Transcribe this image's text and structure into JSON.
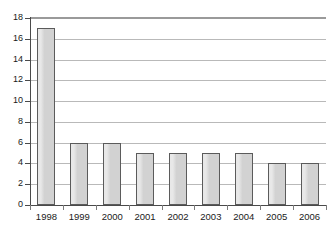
{
  "chart_data": {
    "type": "bar",
    "title": "",
    "subtitle": "",
    "xlabel": "",
    "ylabel": "",
    "categories": [
      "1998",
      "1999",
      "2000",
      "2001",
      "2002",
      "2003",
      "2004",
      "2005",
      "2006"
    ],
    "values": [
      17,
      6,
      6,
      5,
      5,
      5,
      5,
      4,
      4
    ],
    "ylim": [
      0,
      18
    ],
    "ytick_step": 2,
    "yticks": [
      0,
      2,
      4,
      6,
      8,
      10,
      12,
      14,
      16,
      18
    ],
    "ytick_labels": [
      "0",
      "2",
      "4",
      "6",
      "8",
      "10",
      "12",
      "14",
      "16",
      "18"
    ],
    "grid": true,
    "grid_axis": "y",
    "legend": false,
    "legend_position": "none",
    "annotations": [],
    "colors": {
      "bar_fill": "#d6d6d6",
      "bar_border": "#5b5b5b",
      "gridline": "#b9b9b9",
      "axis": "#4a4a4a",
      "text": "#1a1a1a",
      "background": "#ffffff"
    }
  }
}
